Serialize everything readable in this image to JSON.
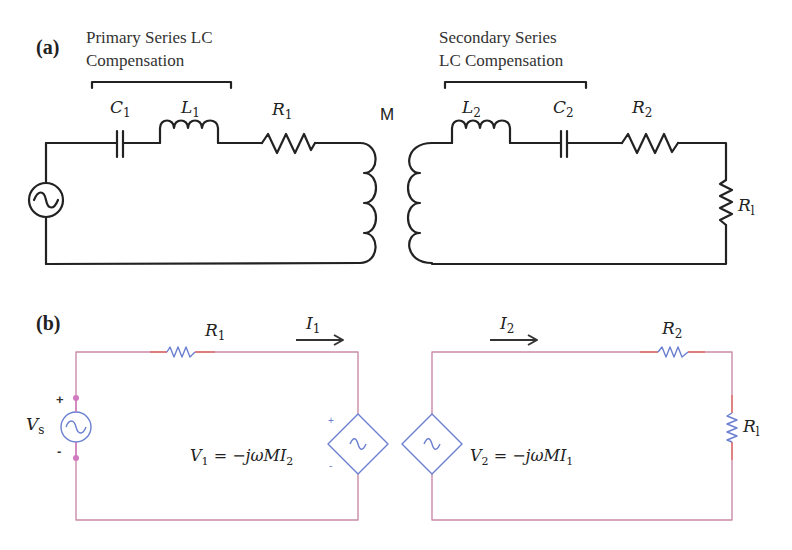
{
  "panel_a": {
    "tag": "(a)",
    "primary_caption": [
      "Primary Series LC",
      "Compensation"
    ],
    "secondary_caption": [
      "Secondary Series",
      "LC Compensation"
    ],
    "components": {
      "C1": {
        "base": "C",
        "sub": "1"
      },
      "L1": {
        "base": "L",
        "sub": "1"
      },
      "R1": {
        "base": "R",
        "sub": "1"
      },
      "M": "M",
      "L2": {
        "base": "L",
        "sub": "2"
      },
      "C2": {
        "base": "C",
        "sub": "2"
      },
      "R2": {
        "base": "R",
        "sub": "2"
      },
      "Rl": {
        "base": "R",
        "sub": "l"
      }
    },
    "wire_color": "#222222"
  },
  "panel_b": {
    "tag": "(b)",
    "labels": {
      "Vs": {
        "base": "V",
        "sub": "s"
      },
      "R1": {
        "base": "R",
        "sub": "1"
      },
      "I1": {
        "base": "I",
        "sub": "1"
      },
      "I2": {
        "base": "I",
        "sub": "2"
      },
      "R2": {
        "base": "R",
        "sub": "2"
      },
      "Rl": {
        "base": "R",
        "sub": "l"
      },
      "plus": "+",
      "minus": "-"
    },
    "equations": {
      "V1": {
        "lhs": "V",
        "lhs_sub": "1",
        "rhs": " = −jωMI",
        "rhs_sub": "2"
      },
      "V2": {
        "lhs": "V",
        "lhs_sub": "2",
        "rhs": " = −jωMI",
        "rhs_sub": "1"
      }
    },
    "wire_color": "#c98aa8",
    "wire_accent_color": "#e0706a",
    "component_color": "#6a7fd0",
    "node_color": "#d27ac0"
  }
}
